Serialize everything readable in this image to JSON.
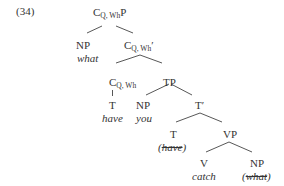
{
  "example_number": "(34)",
  "tree": {
    "root": {
      "cat": "C",
      "sub": "Q, Wh",
      "suffix": "P"
    },
    "spec_np": {
      "cat": "NP",
      "word": "what"
    },
    "cbar": {
      "cat": "C",
      "sub": "Q, Wh",
      "suffix": "′"
    },
    "c_head": {
      "cat": "C",
      "sub": "Q, Wh",
      "suffix": ""
    },
    "c_head_t": {
      "cat": "T",
      "word": "have"
    },
    "tp": {
      "cat": "TP"
    },
    "subj_np": {
      "cat": "NP",
      "word": "you"
    },
    "tbar": {
      "cat": "T′"
    },
    "t_head": {
      "cat": "T",
      "open": "(",
      "word": "have",
      "close": ")"
    },
    "vp": {
      "cat": "VP"
    },
    "v": {
      "cat": "V",
      "word": "catch"
    },
    "obj_np": {
      "cat": "NP",
      "open": "(",
      "word": "what",
      "close": ")"
    }
  },
  "colors": {
    "text": "#333333",
    "line": "#444444",
    "background": "#ffffff"
  }
}
